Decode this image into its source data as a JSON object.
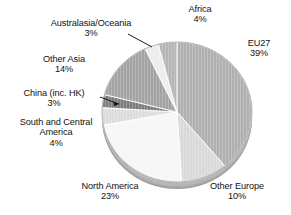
{
  "chart_data": {
    "type": "pie",
    "title": "",
    "subtitle": "",
    "xlabel": "",
    "ylabel": "",
    "legend_position": "none",
    "grid": false,
    "units": "percent",
    "total": 100,
    "start_angle_deg": 0,
    "direction": "clockwise",
    "categories": [
      "EU27",
      "Other Europe",
      "North America",
      "South and Central America",
      "China (inc. HK)",
      "Other Asia",
      "Australasia/Oceania",
      "Africa"
    ],
    "values": [
      39,
      10,
      23,
      4,
      3,
      14,
      3,
      4
    ],
    "slices": [
      {
        "id": "eu27",
        "label": "EU27",
        "value": 39,
        "value_text": "39%",
        "color": "#b0b0b0",
        "edge_color": "#8f8f8f",
        "start_deg": 0,
        "end_deg": 140.4,
        "label_position": "right",
        "leader_line": false
      },
      {
        "id": "other-europe",
        "label": "Other Europe",
        "value": 10,
        "value_text": "10%",
        "color": "#d9d9d9",
        "edge_color": "#b8b8b8",
        "start_deg": 140.4,
        "end_deg": 176.4,
        "label_position": "bottom-right",
        "leader_line": false
      },
      {
        "id": "north-america",
        "label": "North America",
        "value": 23,
        "value_text": "23%",
        "color": "#f6f6f6",
        "edge_color": "#d2d2d2",
        "start_deg": 176.4,
        "end_deg": 259.2,
        "label_position": "bottom-left",
        "leader_line": false
      },
      {
        "id": "south-central-america",
        "label": "South and Central America",
        "value": 4,
        "value_text": "4%",
        "color": "#dcdcdc",
        "edge_color": "#bdbdbd",
        "start_deg": 259.2,
        "end_deg": 273.6,
        "label_position": "left",
        "leader_line": false
      },
      {
        "id": "china-hk",
        "label": "China (inc. HK)",
        "value": 3,
        "value_text": "3%",
        "color": "#7d7d7d",
        "edge_color": "#6a6a6a",
        "start_deg": 273.6,
        "end_deg": 284.4,
        "label_position": "left",
        "leader_line": true
      },
      {
        "id": "other-asia",
        "label": "Other Asia",
        "value": 14,
        "value_text": "14%",
        "color": "#a3a3a3",
        "edge_color": "#8a8a8a",
        "start_deg": 284.4,
        "end_deg": 334.8,
        "label_position": "upper-left",
        "leader_line": false
      },
      {
        "id": "australasia-oceania",
        "label": "Australasia/Oceania",
        "value": 3,
        "value_text": "3%",
        "color": "#ececec",
        "edge_color": "#c6c6c6",
        "start_deg": 334.8,
        "end_deg": 345.6,
        "label_position": "top-left",
        "leader_line": true
      },
      {
        "id": "africa",
        "label": "Africa",
        "value": 4,
        "value_text": "4%",
        "color": "#b5b5b5",
        "edge_color": "#9a9a9a",
        "start_deg": 345.6,
        "end_deg": 360,
        "label_position": "top",
        "leader_line": false
      }
    ]
  },
  "labels": {
    "africa": {
      "name": "Africa",
      "percent": "4%"
    },
    "eu27": {
      "name": "EU27",
      "percent": "39%"
    },
    "other_europe": {
      "name": "Other Europe",
      "percent": "10%"
    },
    "north_america": {
      "name": "North America",
      "percent": "23%"
    },
    "south_central_america": {
      "name": "South and Central America",
      "percent": "4%"
    },
    "china": {
      "name": "China (inc. HK)",
      "percent": "3%"
    },
    "other_asia": {
      "name": "Other Asia",
      "percent": "14%"
    },
    "australasia": {
      "name": "Australasia/Oceania",
      "percent": "3%"
    }
  },
  "style": {
    "background": "#ffffff",
    "text_color": "#111111",
    "leader_line_color": "#1a1a1a"
  }
}
